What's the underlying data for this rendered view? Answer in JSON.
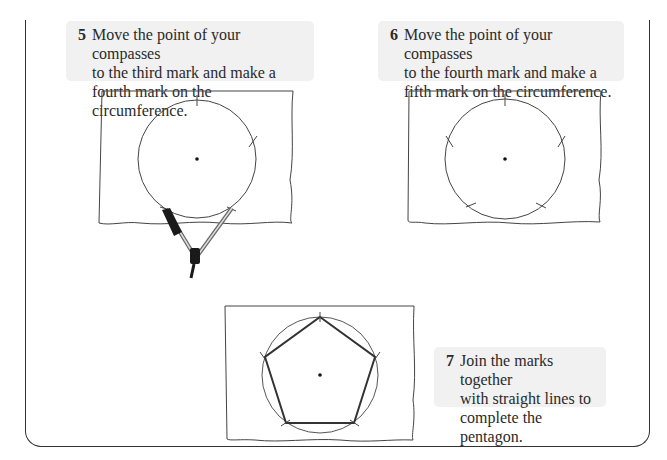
{
  "steps": [
    {
      "number": "5",
      "text": "Move the point of your compasses\nto the third mark and make a\nfourth mark on the circumference."
    },
    {
      "number": "6",
      "text": "Move the point of your compasses\nto the fourth mark and make a\nfifth mark on the circumference."
    },
    {
      "number": "7",
      "text": "Join the marks together\nwith straight lines to\ncomplete the pentagon."
    }
  ],
  "figures": [
    {
      "id": "step-5-figure",
      "description": "Circle with centre point, three marks drawn, compasses making fourth mark"
    },
    {
      "id": "step-6-figure",
      "description": "Circle with centre point and five marks on circumference"
    },
    {
      "id": "step-7-figure",
      "description": "Pentagon drawn by joining the five marks on the circle"
    }
  ],
  "colors": {
    "box_background": "#f1f1f1",
    "line": "#333333"
  }
}
